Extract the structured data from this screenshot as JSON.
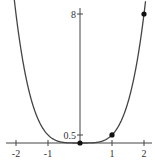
{
  "chart_data": {
    "type": "line",
    "title": "",
    "xlabel": "",
    "ylabel": "",
    "function": "y = x^4 / 2",
    "xlim": [
      -2.1,
      2.2
    ],
    "ylim": [
      0,
      8.5
    ],
    "grid": false,
    "x_ticks": [
      "-2",
      "-1",
      "1",
      "2"
    ],
    "y_ticks": [
      "0.5",
      "8"
    ],
    "series": [
      {
        "name": "curve",
        "x": [
          -2,
          -1.5,
          -1,
          -0.5,
          0,
          0.5,
          1,
          1.5,
          2
        ],
        "values": [
          8,
          2.53,
          0.5,
          0.03,
          0,
          0.03,
          0.5,
          2.53,
          8
        ]
      }
    ],
    "marked_points": [
      {
        "x": 0,
        "y": 0
      },
      {
        "x": 1,
        "y": 0.5
      },
      {
        "x": 2,
        "y": 8
      }
    ]
  },
  "labels": {
    "x_neg2": "-2",
    "x_neg1": "-1",
    "x_1": "1",
    "x_2": "2",
    "y_05": "0.5",
    "y_8": "8"
  }
}
